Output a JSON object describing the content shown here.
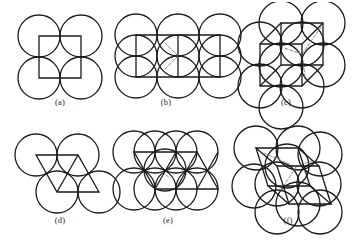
{
  "figure": {
    "background_color": "#ffffff",
    "line_color": "#1a1a1a",
    "dashed_color": "#8a8a8a",
    "circle_stroke_width": 1.3,
    "cell_stroke_width": 1.3,
    "panel_count": 6
  },
  "panels": [
    {
      "id": "a",
      "caption": "(a)",
      "packing_type": "square",
      "cell_shape": "square",
      "dimensionality": "2D",
      "circle_count": 4,
      "circle_radius": 21,
      "circles": [
        {
          "cx": 31,
          "cy": 30
        },
        {
          "cx": 73,
          "cy": 30
        },
        {
          "cx": 31,
          "cy": 72
        },
        {
          "cx": 73,
          "cy": 72
        }
      ],
      "cell_polygons": [
        {
          "name": "unit-square",
          "points": "31,30 73,30 73,72 31,72",
          "closed": true
        }
      ],
      "cell_lines": [],
      "dashed_lines": []
    },
    {
      "id": "b",
      "caption": "(b)",
      "packing_type": "square",
      "cell_shape": "square-pair",
      "dimensionality": "2D",
      "circle_count": 9,
      "circle_radius": 21,
      "circles": [
        {
          "cx": 26,
          "cy": 29
        },
        {
          "cx": 68,
          "cy": 29
        },
        {
          "cx": 110,
          "cy": 29
        },
        {
          "cx": 26,
          "cy": 71
        },
        {
          "cx": 68,
          "cy": 71
        },
        {
          "cx": 110,
          "cy": 71
        },
        {
          "cx": 26,
          "cy": 50
        },
        {
          "cx": 68,
          "cy": 50
        },
        {
          "cx": 110,
          "cy": 50
        }
      ],
      "cell_polygons": [
        {
          "name": "unit-rectangle",
          "points": "26,29 110,29 110,71 26,71",
          "closed": true
        }
      ],
      "cell_lines": [
        {
          "name": "cell-divider-vertical",
          "x1": 68,
          "y1": 29,
          "x2": 68,
          "y2": 71
        }
      ],
      "dashed_lines": [
        {
          "name": "interstitial-diagonal-1",
          "x1": 55,
          "y1": 37,
          "x2": 68,
          "y2": 50
        },
        {
          "name": "interstitial-diagonal-2",
          "x1": 68,
          "y1": 50,
          "x2": 55,
          "y2": 63
        }
      ]
    },
    {
      "id": "c",
      "caption": "(c)",
      "packing_type": "cubic",
      "cell_shape": "cube",
      "dimensionality": "3D",
      "circle_count": 9,
      "circle_radius": 22,
      "circles": [
        {
          "cx": 38,
          "cy": 42
        },
        {
          "cx": 80,
          "cy": 42
        },
        {
          "cx": 38,
          "cy": 84
        },
        {
          "cx": 80,
          "cy": 84
        },
        {
          "cx": 59,
          "cy": 21
        },
        {
          "cx": 101,
          "cy": 21
        },
        {
          "cx": 59,
          "cy": 63
        },
        {
          "cx": 101,
          "cy": 63
        },
        {
          "cx": 59,
          "cy": 105
        }
      ],
      "cell_polygons": [
        {
          "name": "cube-front-face",
          "points": "38,42 80,42 80,84 38,84",
          "closed": true
        },
        {
          "name": "cube-back-face",
          "points": "59,21 101,21 101,63 59,63",
          "closed": true
        }
      ],
      "cell_lines": [
        {
          "name": "cube-edge-connector-1",
          "x1": 38,
          "y1": 42,
          "x2": 59,
          "y2": 21
        },
        {
          "name": "cube-edge-connector-2",
          "x1": 80,
          "y1": 42,
          "x2": 101,
          "y2": 21
        },
        {
          "name": "cube-edge-connector-3",
          "x1": 80,
          "y1": 84,
          "x2": 101,
          "y2": 63
        },
        {
          "name": "cube-edge-connector-4",
          "x1": 38,
          "y1": 84,
          "x2": 59,
          "y2": 63
        }
      ],
      "dashed_lines": [
        {
          "name": "body-diagonal-upper",
          "x1": 80,
          "y1": 52,
          "x2": 99,
          "y2": 25
        },
        {
          "name": "body-diagonal-left",
          "x1": 80,
          "y1": 52,
          "x2": 62,
          "y2": 46
        },
        {
          "name": "body-diagonal-lower",
          "x1": 80,
          "y1": 52,
          "x2": 83,
          "y2": 74
        }
      ]
    },
    {
      "id": "d",
      "caption": "(d)",
      "packing_type": "hexagonal",
      "cell_shape": "rhombus-pair",
      "dimensionality": "2D",
      "circle_count": 4,
      "circle_radius": 21,
      "circles": [
        {
          "cx": 28,
          "cy": 33
        },
        {
          "cx": 70,
          "cy": 33
        },
        {
          "cx": 49,
          "cy": 70
        },
        {
          "cx": 91,
          "cy": 70
        }
      ],
      "cell_polygons": [
        {
          "name": "rhombus-upper",
          "points": "28,33 70,33 91,70 49,70",
          "closed": true
        }
      ],
      "cell_lines": [
        {
          "name": "rhombus-shared-diagonal",
          "x1": 49,
          "y1": 70,
          "x2": 70,
          "y2": 33
        }
      ],
      "dashed_lines": []
    },
    {
      "id": "e",
      "caption": "(e)",
      "packing_type": "hexagonal",
      "cell_shape": "rhombus-band",
      "dimensionality": "2D",
      "circle_count": 9,
      "circle_radius": 21,
      "circles": [
        {
          "cx": 24,
          "cy": 30
        },
        {
          "cx": 66,
          "cy": 30
        },
        {
          "cx": 45,
          "cy": 30
        },
        {
          "cx": 87,
          "cy": 30
        },
        {
          "cx": 24,
          "cy": 67
        },
        {
          "cx": 45,
          "cy": 67
        },
        {
          "cx": 66,
          "cy": 67
        },
        {
          "cx": 87,
          "cy": 67
        },
        {
          "cx": 55,
          "cy": 48
        }
      ],
      "cell_polygons": [
        {
          "name": "rhombus-band",
          "points": "24,30 87,30 108,67 45,67",
          "closed": true
        }
      ],
      "cell_lines": [
        {
          "name": "band-diagonal-1",
          "x1": 45,
          "y1": 67,
          "x2": 66,
          "y2": 30
        },
        {
          "name": "band-diagonal-2",
          "x1": 66,
          "y1": 67,
          "x2": 87,
          "y2": 30
        },
        {
          "name": "band-diagonal-3",
          "x1": 87,
          "y1": 67,
          "x2": 108,
          "y2": 30
        }
      ],
      "dashed_lines": [
        {
          "name": "interstitial-marker",
          "x1": 52,
          "y1": 50,
          "x2": 60,
          "y2": 56
        }
      ]
    },
    {
      "id": "f",
      "caption": "(f)",
      "packing_type": "hexagonal-close-packed",
      "cell_shape": "rhombohedron",
      "dimensionality": "3D",
      "circle_count": 10,
      "circle_radius": 22,
      "circles": [
        {
          "cx": 32,
          "cy": 28
        },
        {
          "cx": 74,
          "cy": 28
        },
        {
          "cx": 96,
          "cy": 34
        },
        {
          "cx": 30,
          "cy": 66
        },
        {
          "cx": 53,
          "cy": 64
        },
        {
          "cx": 95,
          "cy": 64
        },
        {
          "cx": 53,
          "cy": 92
        },
        {
          "cx": 74,
          "cy": 84
        },
        {
          "cx": 96,
          "cy": 92
        },
        {
          "cx": 63,
          "cy": 46
        }
      ],
      "cell_polygons": [
        {
          "name": "rhombohedron-top-face",
          "points": "32,28 74,28 95,46 53,46",
          "closed": true
        },
        {
          "name": "rhombohedron-bottom-face",
          "points": "44,66 86,66 107,84 65,84",
          "closed": true
        }
      ],
      "cell_lines": [
        {
          "name": "rhombohedron-edge-left",
          "x1": 32,
          "y1": 28,
          "x2": 44,
          "y2": 66
        },
        {
          "name": "rhombohedron-edge-front",
          "x1": 53,
          "y1": 46,
          "x2": 65,
          "y2": 84
        },
        {
          "name": "rhombohedron-edge-right",
          "x1": 95,
          "y1": 46,
          "x2": 107,
          "y2": 84
        },
        {
          "name": "rhombohedron-edge-back",
          "x1": 74,
          "y1": 28,
          "x2": 86,
          "y2": 66
        }
      ],
      "dashed_lines": [
        {
          "name": "interior-diagonal-1",
          "x1": 40,
          "y1": 33,
          "x2": 72,
          "y2": 47
        },
        {
          "name": "interior-diagonal-2",
          "x1": 72,
          "y1": 47,
          "x2": 57,
          "y2": 70
        },
        {
          "name": "interior-diagonal-3",
          "x1": 72,
          "y1": 47,
          "x2": 90,
          "y2": 40
        }
      ]
    }
  ]
}
